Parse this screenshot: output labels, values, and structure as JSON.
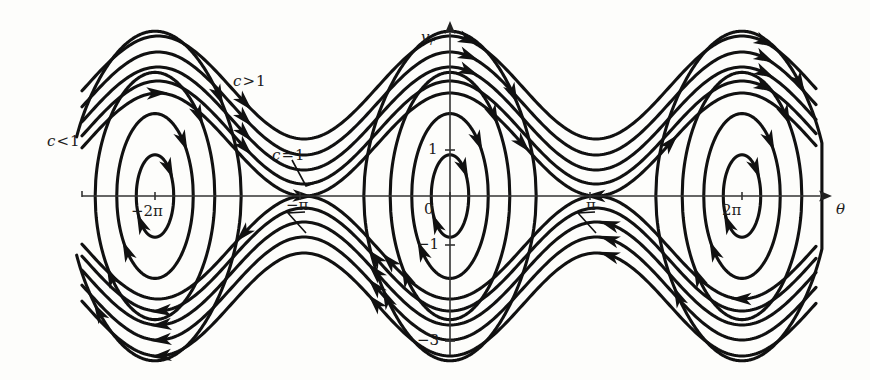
{
  "figure": {
    "kind": "phase-portrait",
    "background_color": "#fdfdfb",
    "curve_color": "#111111",
    "axis_color": "#333333"
  },
  "axes": {
    "x": {
      "label": "θ",
      "label_name": "theta",
      "pixel_y": 196,
      "pixel_x_start": 82,
      "pixel_x_end": 828,
      "arrow": true,
      "ticks": [
        {
          "label": "−2π",
          "value": -6.283,
          "pixel_x": 155
        },
        {
          "label": "−π",
          "value": -3.142,
          "pixel_x": 300
        },
        {
          "label": "0",
          "value": 0,
          "pixel_x": 450
        },
        {
          "label": "π",
          "value": 3.142,
          "pixel_x": 590
        },
        {
          "label": "2π",
          "value": 6.283,
          "pixel_x": 742
        }
      ]
    },
    "y": {
      "label": "v",
      "label_sub": "r",
      "label_name": "v-r",
      "pixel_x": 450,
      "pixel_y_start": 25,
      "pixel_y_end": 355,
      "arrow": true,
      "ticks": [
        {
          "label": "1",
          "value": 1,
          "pixel_y": 150
        },
        {
          "label": "0",
          "value": 0,
          "pixel_y": 196
        },
        {
          "label": "−1",
          "value": -1,
          "pixel_y": 245
        },
        {
          "label": "−3",
          "value": -3,
          "pixel_y": 341
        }
      ]
    }
  },
  "annotations": [
    {
      "name": "c-greater-than-1",
      "text": "c",
      "op": ">",
      "rhs": "1",
      "pixel_x": 233,
      "pixel_y": 74
    },
    {
      "name": "c-less-than-1",
      "text": "c",
      "op": "<",
      "rhs": "1",
      "pixel_x": 47,
      "pixel_y": 134
    },
    {
      "name": "c-equals-1",
      "text": "c",
      "op": "=",
      "rhs": "1",
      "pixel_x": 272,
      "pixel_y": 148
    }
  ],
  "chart_data": {
    "type": "line",
    "title": "",
    "xlabel": "θ",
    "ylabel": "v_r",
    "xlim": [
      -8.2,
      8.2
    ],
    "ylim": [
      -3.4,
      3.4
    ],
    "grid": false,
    "legend": "inline-annotations",
    "x_tick_labels": [
      "−2π",
      "−π",
      "0",
      "π",
      "2π"
    ],
    "x_tick_values": [
      -6.283,
      -3.142,
      0,
      3.142,
      6.283
    ],
    "y_tick_labels": [
      "1",
      "0",
      "−1",
      "−3"
    ],
    "y_tick_values": [
      1,
      0,
      -1,
      -3
    ],
    "fixed_points": {
      "centers": [
        {
          "theta": -6.283,
          "v_r": 0,
          "pixel_x": 155,
          "pixel_y": 196
        },
        {
          "theta": 0,
          "v_r": 0,
          "pixel_x": 450,
          "pixel_y": 196
        },
        {
          "theta": 6.283,
          "v_r": 0,
          "pixel_x": 742,
          "pixel_y": 196
        }
      ],
      "saddles": [
        {
          "theta": -3.142,
          "v_r": 0,
          "pixel_x": 300,
          "pixel_y": 196
        },
        {
          "theta": 3.142,
          "v_r": 0,
          "pixel_x": 590,
          "pixel_y": 196
        }
      ]
    },
    "families": [
      {
        "name": "running-above",
        "label": "c>1",
        "count": 4,
        "direction": "rightward",
        "region": "v_r > separatrix"
      },
      {
        "name": "separatrix",
        "label": "c=1",
        "count": 1,
        "direction": "heteroclinic"
      },
      {
        "name": "librating",
        "label": "c<1",
        "count": 4,
        "direction": "clockwise-closed-orbits"
      },
      {
        "name": "running-below",
        "label": "c>1",
        "count": 4,
        "direction": "leftward",
        "region": "v_r < -separatrix"
      }
    ],
    "separatrix_amplitude_pixels": 103,
    "period_pixels": 292
  }
}
